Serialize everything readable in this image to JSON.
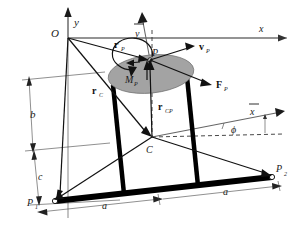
{
  "figure": {
    "background_color": "#ffffff",
    "body_color": "#a3a3a3",
    "line_color": "#111111",
    "axis_color": "#666666"
  },
  "labels": {
    "origin": "O",
    "axis_x": "x",
    "axis_y": "y",
    "axis_x_bar": "x",
    "axis_y_bar": "y",
    "point_P": "P",
    "point_C": "C",
    "point_P1": "P",
    "point_P1_sub": "1",
    "point_P2": "P",
    "point_P2_sub": "2",
    "angle_phi": "ϕ",
    "moment_MP": "M",
    "moment_MP_sub": "P",
    "force_FP": "F",
    "force_FP_sub": "P",
    "velocity_vP": "v",
    "velocity_vP_sub": "P",
    "vector_rP": "r",
    "vector_rP_sub": "P",
    "vector_rC": "r",
    "vector_rC_sub": "C",
    "vector_rCP": "r",
    "vector_rCP_sub": "CP",
    "dim_b": "b",
    "dim_c": "c",
    "dim_a_left": "a",
    "dim_a_right": "a"
  },
  "geometry": {
    "origin_px": [
      68,
      38
    ],
    "point_P_px": [
      150,
      60
    ],
    "point_C_px": [
      152,
      137
    ],
    "point_P1_px": [
      53,
      200
    ],
    "point_P2_px": [
      272,
      177
    ],
    "x_axis_end_px": [
      287,
      38
    ],
    "y_axis_end_px": [
      68,
      8
    ]
  }
}
